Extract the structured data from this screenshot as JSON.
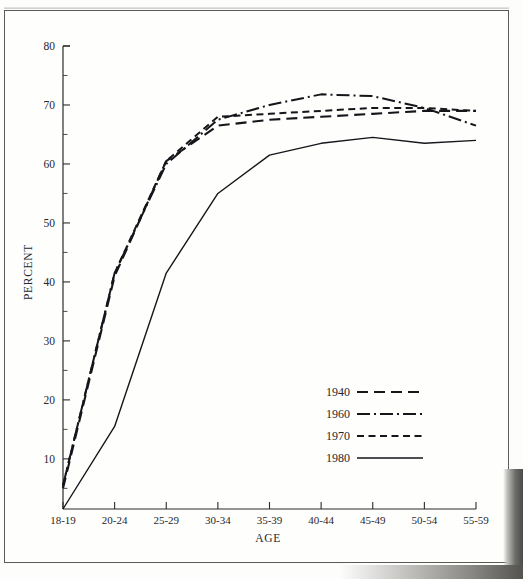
{
  "figure": {
    "y_axis_title": "PERCENT",
    "x_axis_title": "AGE"
  },
  "chart_data": {
    "type": "line",
    "title": "",
    "subtitle": "",
    "xlabel": "AGE",
    "ylabel": "PERCENT",
    "categories": [
      "18-19",
      "20-24",
      "25-29",
      "30-34",
      "35-39",
      "40-44",
      "45-49",
      "50-54",
      "55-59"
    ],
    "ylim": [
      1.5,
      80
    ],
    "ytick_labels": [
      "10",
      "20",
      "30",
      "40",
      "50",
      "60",
      "70",
      "80"
    ],
    "ytick_values": [
      10,
      20,
      30,
      40,
      50,
      60,
      70,
      80
    ],
    "yminor_step": 5,
    "grid": false,
    "legend_position": "center-right-lower",
    "series": [
      {
        "name": "1940",
        "linestyle": "long-dash",
        "values": [
          5.0,
          41.0,
          60.5,
          66.5,
          67.5,
          68.0,
          68.5,
          69.0,
          69.0
        ]
      },
      {
        "name": "1960",
        "linestyle": "dash-dot",
        "values": [
          5.5,
          41.5,
          60.0,
          67.5,
          70.0,
          71.8,
          71.5,
          69.5,
          66.5
        ]
      },
      {
        "name": "1970",
        "linestyle": "short-dash",
        "values": [
          5.5,
          41.5,
          60.5,
          68.0,
          68.5,
          69.0,
          69.5,
          69.5,
          69.0
        ]
      },
      {
        "name": "1980",
        "linestyle": "solid",
        "values": [
          1.5,
          15.5,
          41.5,
          55.0,
          61.5,
          63.5,
          64.5,
          63.5,
          64.0
        ]
      }
    ]
  },
  "legend": {
    "entries": [
      {
        "label": "1940",
        "linestyle": "long-dash"
      },
      {
        "label": "1960",
        "linestyle": "dash-dot"
      },
      {
        "label": "1970",
        "linestyle": "short-dash"
      },
      {
        "label": "1980",
        "linestyle": "solid"
      }
    ]
  },
  "colors": {
    "ink": "#15151a",
    "frame": "#5a5a58",
    "paper": "#fefefd"
  }
}
